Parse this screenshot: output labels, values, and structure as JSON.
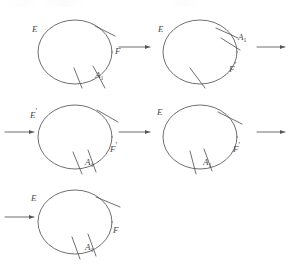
{
  "figure": {
    "type": "math-diagram",
    "stroke_color": "#55545a",
    "label_color": "#4a4a4a",
    "background": "#ffffff",
    "steps": [
      {
        "id": "circle-1",
        "center": [
          75,
          52
        ],
        "radius": 37,
        "labels": {
          "left": "E",
          "right": "F",
          "bottom": "A",
          "bottom_sub": "1"
        },
        "marks": 3
      },
      {
        "id": "circle-2",
        "center": [
          200,
          52
        ],
        "radius": 37,
        "labels": {
          "left": "E",
          "right": "A",
          "right_sub": "1",
          "bottom": "F",
          "bottom_prime": "'"
        },
        "marks": 3
      },
      {
        "id": "circle-3",
        "center": [
          75,
          137
        ],
        "radius": 37,
        "labels": {
          "left": "E",
          "left_prime": "'",
          "right": "F",
          "right_prime": "'",
          "bottom": "A",
          "bottom_sub": "1"
        },
        "marks": 3
      },
      {
        "id": "circle-4",
        "center": [
          200,
          137
        ],
        "radius": 37,
        "labels": {
          "left": "E",
          "right": "F",
          "right_prime": "'",
          "bottom": "A",
          "bottom_sub": "1"
        },
        "marks": 3
      },
      {
        "id": "circle-5",
        "center": [
          75,
          222
        ],
        "radius": 37,
        "labels": {
          "left": "E",
          "right": "F",
          "bottom": "A",
          "bottom_sub": "1"
        },
        "marks": 3
      }
    ],
    "arrows": [
      {
        "id": "arrow-1",
        "from": [
          119,
          47
        ],
        "to": [
          152,
          47
        ]
      },
      {
        "id": "arrow-2",
        "from": [
          255,
          47
        ],
        "to": [
          286,
          47
        ]
      },
      {
        "id": "arrow-3",
        "from": [
          5,
          132
        ],
        "to": [
          36,
          132
        ]
      },
      {
        "id": "arrow-4",
        "from": [
          119,
          132
        ],
        "to": [
          152,
          132
        ]
      },
      {
        "id": "arrow-5",
        "from": [
          255,
          132
        ],
        "to": [
          286,
          132
        ]
      },
      {
        "id": "arrow-6",
        "from": [
          5,
          217
        ],
        "to": [
          36,
          217
        ]
      }
    ]
  },
  "labels": {
    "c1_E": "E",
    "c1_F": "F",
    "c1_A": "A",
    "c1_A_sub": "1",
    "c2_E": "E",
    "c2_A": "A",
    "c2_A_sub": "1",
    "c2_F": "F",
    "c2_F_prime": "′",
    "c3_E": "E",
    "c3_E_prime": "′",
    "c3_F": "F",
    "c3_F_prime": "′",
    "c3_A": "A",
    "c3_A_sub": "1",
    "c4_E": "E",
    "c4_F": "F",
    "c4_F_prime": "′",
    "c4_A": "A",
    "c4_A_sub": "1",
    "c5_E": "E",
    "c5_F": "F",
    "c5_A": "A",
    "c5_A_sub": "1"
  }
}
